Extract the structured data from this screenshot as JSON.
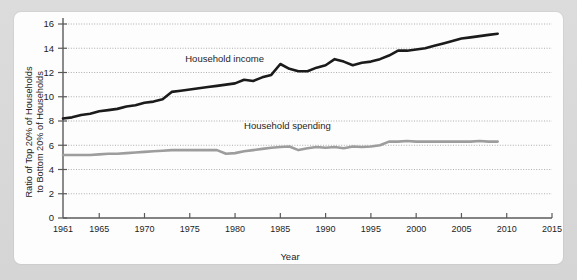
{
  "page": {
    "top_caption": "",
    "background_color": "#d8d8d8",
    "card_color": "#fdfdfd"
  },
  "chart_data": {
    "type": "line",
    "title": "",
    "xlabel": "Year",
    "ylabel": "Ratio of Top 20% of Households to Bottom 20% of Households",
    "ylabel_line1": "Ratio of Top 20% of Households",
    "ylabel_line2": "to Bottom 20% of Households",
    "xlim": [
      1961,
      2015
    ],
    "ylim": [
      0,
      16
    ],
    "yticks": [
      0,
      2,
      4,
      6,
      8,
      10,
      12,
      14,
      16
    ],
    "xticks": [
      1961,
      1965,
      1970,
      1975,
      1980,
      1985,
      1990,
      1995,
      2000,
      2005,
      2010,
      2015
    ],
    "grid": "horizontal-dotted",
    "legend": "inline-annotations",
    "annotations": [
      {
        "text": "Household income",
        "x": 1974.5,
        "y": 12.9
      },
      {
        "text": "Household spending",
        "x": 1981.0,
        "y": 7.3
      }
    ],
    "series": [
      {
        "name": "Household income",
        "color": "#1b1b1b",
        "x": [
          1961,
          1962,
          1963,
          1964,
          1965,
          1966,
          1967,
          1968,
          1969,
          1970,
          1971,
          1972,
          1973,
          1974,
          1975,
          1976,
          1977,
          1978,
          1979,
          1980,
          1981,
          1982,
          1983,
          1984,
          1985,
          1986,
          1987,
          1988,
          1989,
          1990,
          1991,
          1992,
          1993,
          1994,
          1995,
          1996,
          1997,
          1998,
          1999,
          2000,
          2001,
          2002,
          2003,
          2004,
          2005,
          2006,
          2007,
          2008,
          2009
        ],
        "values": [
          8.2,
          8.3,
          8.5,
          8.6,
          8.8,
          8.9,
          9.0,
          9.2,
          9.3,
          9.5,
          9.6,
          9.8,
          10.4,
          10.5,
          10.6,
          10.7,
          10.8,
          10.9,
          11.0,
          11.1,
          11.4,
          11.3,
          11.6,
          11.8,
          12.7,
          12.3,
          12.1,
          12.1,
          12.4,
          12.6,
          13.1,
          12.9,
          12.6,
          12.8,
          12.9,
          13.1,
          13.4,
          13.8,
          13.8,
          13.9,
          14.0,
          14.2,
          14.4,
          14.6,
          14.8,
          14.9,
          15.0,
          15.1,
          15.2
        ],
        "linewidth": 2.6
      },
      {
        "name": "Household spending",
        "color": "#9d9d9d",
        "x": [
          1961,
          1962,
          1963,
          1964,
          1965,
          1966,
          1967,
          1968,
          1969,
          1970,
          1971,
          1972,
          1973,
          1974,
          1975,
          1976,
          1977,
          1978,
          1979,
          1980,
          1981,
          1982,
          1983,
          1984,
          1985,
          1986,
          1987,
          1988,
          1989,
          1990,
          1991,
          1992,
          1993,
          1994,
          1995,
          1996,
          1997,
          1998,
          1999,
          2000,
          2001,
          2002,
          2003,
          2004,
          2005,
          2006,
          2007,
          2008,
          2009
        ],
        "values": [
          5.2,
          5.2,
          5.2,
          5.2,
          5.25,
          5.3,
          5.3,
          5.35,
          5.4,
          5.45,
          5.5,
          5.55,
          5.6,
          5.6,
          5.6,
          5.6,
          5.6,
          5.6,
          5.3,
          5.35,
          5.5,
          5.6,
          5.7,
          5.8,
          5.85,
          5.9,
          5.6,
          5.75,
          5.85,
          5.8,
          5.85,
          5.75,
          5.9,
          5.85,
          5.9,
          6.0,
          6.3,
          6.3,
          6.35,
          6.3,
          6.3,
          6.3,
          6.3,
          6.3,
          6.3,
          6.3,
          6.35,
          6.3,
          6.3
        ],
        "linewidth": 2.6
      }
    ]
  }
}
